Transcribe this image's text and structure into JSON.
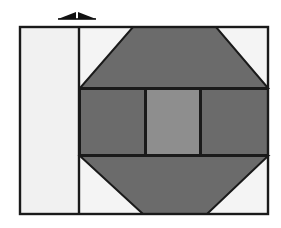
{
  "figure": {
    "type": "technical-line-drawing",
    "title": "",
    "caption": "",
    "canvas": {
      "width": 281,
      "height": 228,
      "background": "#ffffff"
    },
    "palette": {
      "outline": "#1a1a1a",
      "background_white": "#ffffff",
      "panel_light": "#f1f1f1",
      "field_light": "#f4f4f4",
      "block_dark": "#6b6b6b",
      "block_mid": "#8e8e8e",
      "arrow": "#111111"
    },
    "annotations": {
      "arrow": {
        "name": "double-headed-arrow",
        "label": "",
        "direction": "horizontal-bidirectional",
        "x_start": 58,
        "x_end": 96,
        "y": 16
      }
    },
    "frame": {
      "name": "outer-frame",
      "x": 19,
      "y": 26,
      "width": 250,
      "height": 189,
      "stroke": "#1a1a1a",
      "stroke_width": 2,
      "fill": "#f4f4f4"
    },
    "divider": {
      "name": "vertical-divider",
      "x": 79,
      "y_top": 26,
      "y_bottom": 215,
      "stroke": "#1a1a1a",
      "stroke_width": 2
    },
    "regions": [
      {
        "name": "left-panel",
        "shape": "rectangle",
        "fill": "#f1f1f1",
        "points": "20,27 78,27 78,214 20,214"
      },
      {
        "name": "top-trapezoid",
        "shape": "trapezoid",
        "orientation": "narrow-top",
        "fill": "#6b6b6b",
        "points": "133,27 216,27 268,88 80,88"
      },
      {
        "name": "middle-left-block",
        "shape": "rectangle",
        "fill": "#6b6b6b",
        "points": "80,89 145,89 145,155 80,155"
      },
      {
        "name": "middle-center-block",
        "shape": "rectangle",
        "fill": "#8e8e8e",
        "points": "146,89 200,89 200,155 146,155"
      },
      {
        "name": "middle-right-block",
        "shape": "rectangle",
        "fill": "#6b6b6b",
        "points": "201,89 268,89 268,155 201,155"
      },
      {
        "name": "bottom-trapezoid",
        "shape": "trapezoid",
        "orientation": "narrow-bottom",
        "fill": "#6b6b6b",
        "points": "80,156 268,156 207,214 143,214"
      }
    ],
    "corner_fills": [
      {
        "name": "top-left-corner-void",
        "fill": "#f4f4f4",
        "points": "80,27 133,27 80,88"
      },
      {
        "name": "top-right-corner-void",
        "fill": "#f4f4f4",
        "points": "216,27 268,27 268,88"
      },
      {
        "name": "bottom-left-corner-void",
        "fill": "#f4f4f4",
        "points": "80,156 143,214 80,214"
      },
      {
        "name": "bottom-right-corner-void",
        "fill": "#f4f4f4",
        "points": "268,156 268,214 207,214"
      }
    ]
  }
}
